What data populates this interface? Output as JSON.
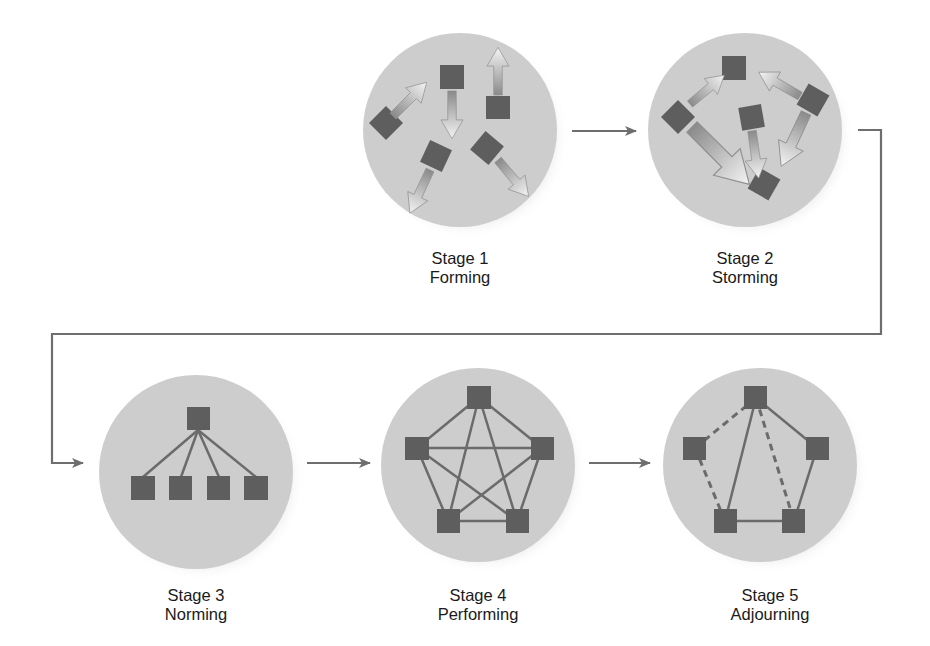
{
  "colors": {
    "background": "#ffffff",
    "circle_fill": "#cdcdcd",
    "circle_shadow": "#a8a8a8",
    "node_fill": "#5e5e5e",
    "line": "#6b6b6b",
    "connector": "#6e6e6e",
    "text": "#1a1a1a"
  },
  "stages": [
    {
      "number_label": "Stage 1",
      "name": "Forming",
      "pattern": "scattered-outward-arrows"
    },
    {
      "number_label": "Stage 2",
      "name": "Storming",
      "pattern": "conflicting-arrows"
    },
    {
      "number_label": "Stage 3",
      "name": "Norming",
      "pattern": "hierarchy-tree"
    },
    {
      "number_label": "Stage 4",
      "name": "Performing",
      "pattern": "fully-connected-pentagon"
    },
    {
      "number_label": "Stage 5",
      "name": "Adjourning",
      "pattern": "partially-dashed-pentagon"
    }
  ],
  "flow": [
    "Stage 1",
    "Stage 2",
    "Stage 3",
    "Stage 4",
    "Stage 5"
  ]
}
